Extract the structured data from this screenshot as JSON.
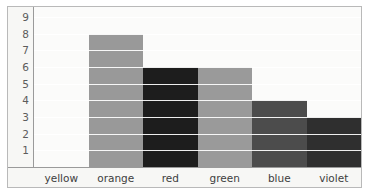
{
  "chart_data": {
    "type": "bar",
    "title": "",
    "subtitle": "",
    "xlabel": "",
    "ylabel": "",
    "categories": [
      "yellow",
      "orange",
      "red",
      "green",
      "blue",
      "violet"
    ],
    "values": [
      9,
      8,
      6,
      6,
      4,
      3
    ],
    "series": [
      {
        "name": "count",
        "values": [
          9,
          8,
          6,
          6,
          4,
          3
        ]
      }
    ],
    "bar_colors": [
      "#fbfbfa",
      "#999999",
      "#1d1d1d",
      "#9a9a9a",
      "#4c4c4c",
      "#2f2f2f"
    ],
    "ylim": [
      0,
      9.6
    ],
    "ytick_labels": [
      "9",
      "8",
      "7",
      "6",
      "5",
      "4",
      "3",
      "2",
      "1"
    ],
    "ytick_values": [
      9,
      8,
      7,
      6,
      5,
      4,
      3,
      2,
      1
    ],
    "grid": true,
    "grid_orientation": "horizontal",
    "grid_color": "#ffffff",
    "legend": false,
    "legend_position": "none",
    "annotations": [],
    "axis_line_color": "#9a9a9a",
    "plot_background": "#fbfbfa",
    "figure_background": "#f7f7f5",
    "frame_border_color": "#b9b9b9",
    "tick_label_color": "#5c5c5c",
    "category_label_color": "#3e3e3e"
  }
}
